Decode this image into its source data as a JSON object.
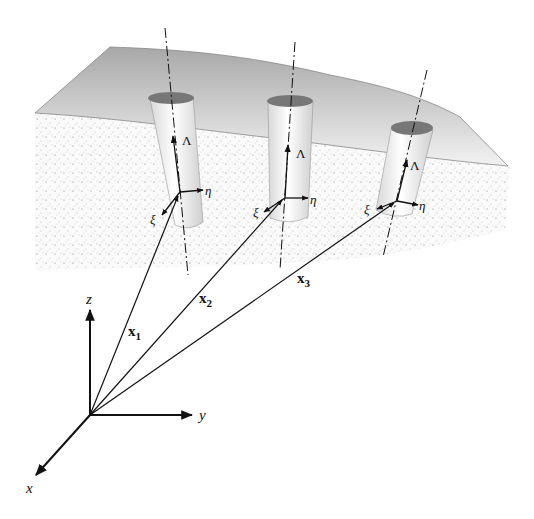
{
  "diagram": {
    "global_axes": {
      "x": "x",
      "y": "y",
      "z": "z"
    },
    "position_vectors": [
      {
        "name": "x",
        "sub": "1"
      },
      {
        "name": "x",
        "sub": "2"
      },
      {
        "name": "x",
        "sub": "3"
      }
    ],
    "local_frames": [
      {
        "axial": "Λ",
        "eta": "η",
        "xi": "ξ"
      },
      {
        "axial": "Λ",
        "eta": "η",
        "xi": "ξ"
      },
      {
        "axial": "Λ",
        "eta": "η",
        "xi": "ξ"
      }
    ],
    "colors": {
      "surface_top": "#a9a9a9",
      "surface_bottom": "#efefef",
      "ground": "#f6f6f6",
      "cylinder_cap": "#777777",
      "line": "#111111"
    }
  }
}
